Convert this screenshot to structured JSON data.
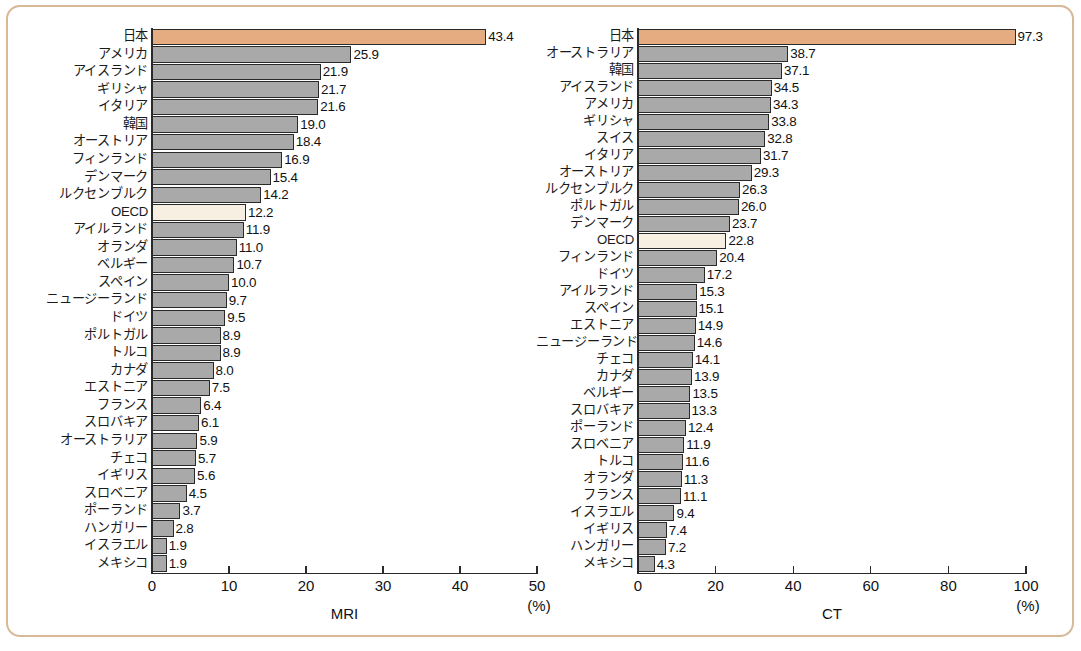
{
  "figure": {
    "background_color": "#ffffff",
    "frame_color": "#d8b896",
    "bar_color": "#a9a9a9",
    "highlight_japan_color": "#e4ac80",
    "highlight_oecd_color": "#f7efe1",
    "axis_color": "#2a2a2a"
  },
  "chart_data": [
    {
      "type": "bar",
      "orientation": "horizontal",
      "title": "",
      "xlabel": "MRI",
      "unit_label": "(%)",
      "ylabel": "",
      "xlim": [
        0,
        50
      ],
      "xticks": [
        0,
        10,
        20,
        30,
        40,
        50
      ],
      "xtick_labels": [
        "0",
        "10",
        "20",
        "30",
        "40",
        "50"
      ],
      "grid": false,
      "legend": "none",
      "highlight_categories": [
        "日本",
        "OECD"
      ],
      "categories": [
        "日本",
        "アメリカ",
        "アイスランド",
        "ギリシャ",
        "イタリア",
        "韓国",
        "オーストリア",
        "フィンランド",
        "デンマーク",
        "ルクセンブルク",
        "OECD",
        "アイルランド",
        "オランダ",
        "ベルギー",
        "スペイン",
        "ニュージーランド",
        "ドイツ",
        "ポルトガル",
        "トルコ",
        "カナダ",
        "エストニア",
        "フランス",
        "スロバキア",
        "オーストラリア",
        "チェコ",
        "イギリス",
        "スロベニア",
        "ポーランド",
        "ハンガリー",
        "イスラエル",
        "メキシコ"
      ],
      "values": [
        43.4,
        25.9,
        21.9,
        21.7,
        21.6,
        19.0,
        18.4,
        16.9,
        15.4,
        14.2,
        12.2,
        11.9,
        11.0,
        10.7,
        10.0,
        9.7,
        9.5,
        8.9,
        8.9,
        8.0,
        7.5,
        6.4,
        6.1,
        5.9,
        5.7,
        5.6,
        4.5,
        3.7,
        2.8,
        1.9,
        1.9
      ],
      "value_labels": [
        "43.4",
        "25.9",
        "21.9",
        "21.7",
        "21.6",
        "19.0",
        "18.4",
        "16.9",
        "15.4",
        "14.2",
        "12.2",
        "11.9",
        "11.0",
        "10.7",
        "10.0",
        "9.7",
        "9.5",
        "8.9",
        "8.9",
        "8.0",
        "7.5",
        "6.4",
        "6.1",
        "5.9",
        "5.7",
        "5.6",
        "4.5",
        "3.7",
        "2.8",
        "1.9",
        "1.9"
      ]
    },
    {
      "type": "bar",
      "orientation": "horizontal",
      "title": "",
      "xlabel": "CT",
      "unit_label": "(%)",
      "ylabel": "",
      "xlim": [
        0,
        100
      ],
      "xticks": [
        0,
        20,
        40,
        60,
        80,
        100
      ],
      "xtick_labels": [
        "0",
        "20",
        "40",
        "60",
        "80",
        "100"
      ],
      "grid": false,
      "legend": "none",
      "highlight_categories": [
        "日本",
        "OECD"
      ],
      "categories": [
        "日本",
        "オーストラリア",
        "韓国",
        "アイスランド",
        "アメリカ",
        "ギリシャ",
        "スイス",
        "イタリア",
        "オーストリア",
        "ルクセンブルク",
        "ポルトガル",
        "デンマーク",
        "OECD",
        "フィンランド",
        "ドイツ",
        "アイルランド",
        "スペイン",
        "エストニア",
        "ニュージーランド",
        "チェコ",
        "カナダ",
        "ベルギー",
        "スロバキア",
        "ポーランド",
        "スロベニア",
        "トルコ",
        "オランダ",
        "フランス",
        "イスラエル",
        "イギリス",
        "ハンガリー",
        "メキシコ"
      ],
      "values": [
        97.3,
        38.7,
        37.1,
        34.5,
        34.3,
        33.8,
        32.8,
        31.7,
        29.3,
        26.3,
        26.0,
        23.7,
        22.8,
        20.4,
        17.2,
        15.3,
        15.1,
        14.9,
        14.6,
        14.1,
        13.9,
        13.5,
        13.3,
        12.4,
        11.9,
        11.6,
        11.3,
        11.1,
        9.4,
        7.4,
        7.2,
        4.3
      ],
      "value_labels": [
        "97.3",
        "38.7",
        "37.1",
        "34.5",
        "34.3",
        "33.8",
        "32.8",
        "31.7",
        "29.3",
        "26.3",
        "26.0",
        "23.7",
        "22.8",
        "20.4",
        "17.2",
        "15.3",
        "15.1",
        "14.9",
        "14.6",
        "14.1",
        "13.9",
        "13.5",
        "13.3",
        "12.4",
        "11.9",
        "11.6",
        "11.3",
        "11.1",
        "9.4",
        "7.4",
        "7.2",
        "4.3"
      ]
    }
  ]
}
